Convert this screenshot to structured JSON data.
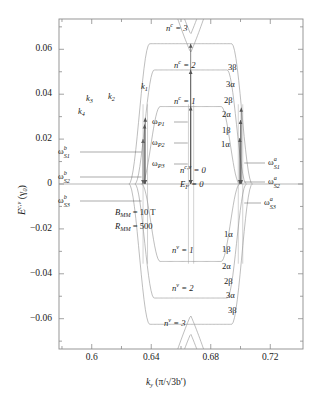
{
  "figure": {
    "kind": "band-structure-landau-levels",
    "axes": {
      "xlabel_main": "k",
      "xlabel_sub": "y",
      "xlabel_units": "(π/√3b′)",
      "ylabel_main": "E",
      "ylabel_sup": "c,v",
      "ylabel_units": "(γ",
      "ylabel_units_sub": "0",
      "ylabel_units_close": ")",
      "x_ticks": [
        "0.6",
        "0.64",
        "0.68",
        "0.72"
      ],
      "x_tick_values": [
        0.6,
        0.64,
        0.68,
        0.72
      ],
      "y_ticks": [
        "0.06",
        "0.04",
        "0.02",
        "0",
        "-0.02",
        "-0.04",
        "-0.06"
      ],
      "y_tick_values": [
        0.06,
        0.04,
        0.02,
        0,
        -0.02,
        -0.04,
        -0.06
      ],
      "xlim": [
        0.578,
        0.742
      ],
      "ylim": [
        -0.0735,
        0.0735
      ],
      "x_minor_per_major": 2,
      "y_minor_per_major": 2
    },
    "parameters": [
      {
        "name": "B",
        "sub": "MM",
        "value": "= 10 T"
      },
      {
        "name": "R",
        "sub": "MM",
        "value": "= 500"
      }
    ],
    "annotations": {
      "conduction_levels": [
        {
          "label": "n",
          "sup": "c",
          "value": "= 3"
        },
        {
          "label": "n",
          "sup": "c",
          "value": "= 2"
        },
        {
          "label": "n",
          "sup": "c",
          "value": "= 1"
        }
      ],
      "fermi_level": [
        {
          "label": "n",
          "sup": "c,v",
          "value": "= 0"
        },
        {
          "label": "E",
          "sub": "F",
          "value": "= 0"
        }
      ],
      "valence_levels": [
        {
          "label": "n",
          "sup": "v",
          "value": "= 1"
        },
        {
          "label": "n",
          "sup": "v",
          "value": "= 2"
        },
        {
          "label": "n",
          "sup": "v",
          "value": "= 3"
        }
      ],
      "k_markers": [
        {
          "label": "k",
          "sub": "1"
        },
        {
          "label": "k",
          "sub": "2"
        },
        {
          "label": "k",
          "sub": "3"
        },
        {
          "label": "k",
          "sub": "4"
        }
      ],
      "omega_P": [
        {
          "sym": "ω",
          "sub": "P1"
        },
        {
          "sym": "ω",
          "sub": "P2"
        },
        {
          "sym": "ω",
          "sub": "P3"
        }
      ],
      "omega_S_left": [
        {
          "sym": "ω",
          "sup": "b",
          "sub": "S1"
        },
        {
          "sym": "ω",
          "sup": "b",
          "sub": "S2"
        },
        {
          "sym": "ω",
          "sup": "b",
          "sub": "S3"
        }
      ],
      "omega_S_right": [
        {
          "sym": "ω",
          "sup": "a",
          "sub": "S1"
        },
        {
          "sym": "ω",
          "sup": "a",
          "sub": "S2"
        },
        {
          "sym": "ω",
          "sup": "a",
          "sub": "S3"
        }
      ],
      "greek_upper_right": [
        "3β",
        "3α",
        "2β",
        "2α",
        "1β",
        "1α"
      ],
      "greek_lower_right": [
        "1α",
        "1β",
        "2α",
        "2β",
        "3α",
        "3β"
      ]
    },
    "colors": {
      "curve": "#9a9a9a",
      "frame": "#8c8c8c",
      "text": "#1a1a1a",
      "background": "#ffffff"
    }
  },
  "chart_data": {
    "type": "line",
    "title": "",
    "xlabel": "k_y (π/√3b′)",
    "ylabel": "E^{c,v} (γ_0)",
    "xlim": [
      0.578,
      0.742
    ],
    "ylim": [
      -0.0735,
      0.0735
    ],
    "grid": false,
    "legend": "none",
    "series": [
      {
        "name": "n^c = 1",
        "band": "conduction",
        "flat_energy": 0.0345,
        "extent_x": [
          0.637,
          0.698
        ]
      },
      {
        "name": "n^c = 2",
        "band": "conduction",
        "flat_energy": 0.0508,
        "extent_x": [
          0.63,
          0.705
        ]
      },
      {
        "name": "n^c = 3",
        "band": "conduction",
        "flat_energy": 0.0625,
        "extent_x": [
          0.624,
          0.711
        ]
      },
      {
        "name": "n^{c,v} = 0",
        "band": "zero",
        "flat_energy": 0.0,
        "extent_x": [
          0.578,
          0.742
        ]
      },
      {
        "name": "n^v = 1",
        "band": "valence",
        "flat_energy": -0.0345,
        "extent_x": [
          0.637,
          0.698
        ]
      },
      {
        "name": "n^v = 2",
        "band": "valence",
        "flat_energy": -0.0508,
        "extent_x": [
          0.63,
          0.705
        ]
      },
      {
        "name": "n^v = 3",
        "band": "valence",
        "flat_energy": -0.0625,
        "extent_x": [
          0.624,
          0.711
        ]
      }
    ],
    "transitions": [
      {
        "name": "ω_P1",
        "x": 0.6665,
        "from": 0.0,
        "to": 0.0345
      },
      {
        "name": "ω_P2",
        "x": 0.6665,
        "from": 0.0,
        "to": 0.0508
      },
      {
        "name": "ω_P3",
        "x": 0.6665,
        "from": 0.0,
        "to": 0.0625
      },
      {
        "name": "ω^b_S1",
        "x": 0.6345,
        "from": 0.0,
        "to": 0.02
      },
      {
        "name": "ω^b_S2",
        "x": 0.6355,
        "from": 0.0,
        "to": 0.0265
      },
      {
        "name": "ω^b_S3",
        "x": 0.636,
        "from": 0.0,
        "to": 0.0295
      },
      {
        "name": "ω^a_S1",
        "x": 0.6995,
        "from": 0.0,
        "to": 0.0205
      },
      {
        "name": "ω^a_S2",
        "x": 0.7,
        "from": 0.0,
        "to": 0.0285
      },
      {
        "name": "ω^a_S3",
        "x": 0.7005,
        "from": 0.0,
        "to": 0.034
      }
    ]
  }
}
